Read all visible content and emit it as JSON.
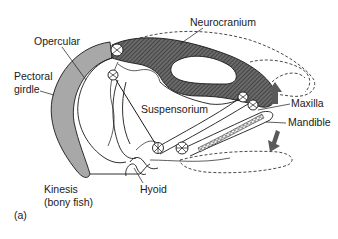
{
  "figure": {
    "panel_label": "(a)",
    "caption_title": "Kinesis",
    "caption_subtitle": "(bony fish)",
    "colors": {
      "hatch_fill": "#5a5a5a",
      "girdle_fill": "#a8a8a8",
      "arrow_fill": "#5a5a5a",
      "stroke": "#1a1a1a"
    }
  },
  "labels": {
    "neurocranium": "Neurocranium",
    "opercular": "Opercular",
    "pectoral_line1": "Pectoral",
    "pectoral_line2": "girdle",
    "suspensorium": "Suspensorium",
    "maxilla": "Maxilla",
    "mandible": "Mandible",
    "hyoid": "Hyoid"
  },
  "arrows": [
    {
      "name": "upward-arrow",
      "direction": "up"
    },
    {
      "name": "downward-arrow",
      "direction": "down"
    }
  ]
}
